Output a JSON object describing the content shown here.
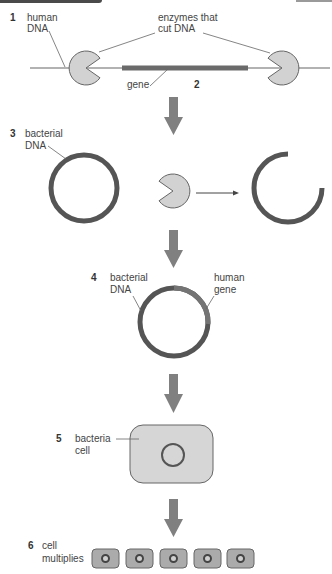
{
  "colors": {
    "dna_strand": "#555555",
    "gene": "#6a6a6a",
    "human_gene_segment": "#737373",
    "enzyme_fill": "#d2d2d2",
    "outline": "#666666",
    "arrow": "#808080",
    "big_cell_fill": "#d6d6d6",
    "small_cell_fill": "#ababab"
  },
  "steps": [
    {
      "number": "1",
      "labels": {
        "human_dna_line1": "human",
        "human_dna_line2": "DNA",
        "enzymes_line1": "enzymes that",
        "enzymes_line2": "cut DNA",
        "gene": "gene"
      }
    },
    {
      "number": "2"
    },
    {
      "number": "3",
      "labels": {
        "bacterial_dna_line1": "bacterial",
        "bacterial_dna_line2": "DNA"
      }
    },
    {
      "number": "4",
      "labels": {
        "bacterial_dna_line1": "bacterial",
        "bacterial_dna_line2": "DNA",
        "human_gene_line1": "human",
        "human_gene_line2": "gene"
      }
    },
    {
      "number": "5",
      "labels": {
        "bacteria_cell_line1": "bacteria",
        "bacteria_cell_line2": "cell"
      }
    },
    {
      "number": "6",
      "labels": {
        "cell_multiplies_line1": "cell",
        "cell_multiplies_line2": "multiplies"
      },
      "cell_count": 5
    }
  ]
}
